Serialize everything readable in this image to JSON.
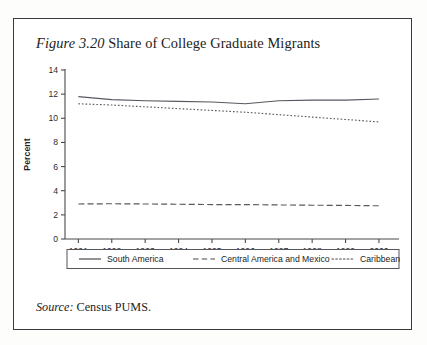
{
  "figure": {
    "number_label": "Figure 3.20",
    "title_text": "Share of College Graduate Migrants",
    "source_label": "Source:",
    "source_text": "Census PUMS."
  },
  "chart_data": {
    "type": "line",
    "title": "Figure 3.20 Share of College Graduate Migrants",
    "xlabel": "",
    "ylabel": "Percent",
    "x": [
      1991,
      1992,
      1993,
      1994,
      1995,
      1996,
      1997,
      1998,
      1999,
      2000
    ],
    "categories": [
      "1991",
      "1992",
      "1993",
      "1994",
      "1995",
      "1996",
      "1997",
      "1998",
      "1999",
      "2000"
    ],
    "xlim": [
      1990.6,
      2000.6
    ],
    "ylim": [
      0,
      14
    ],
    "yticks": [
      0,
      2,
      4,
      6,
      8,
      10,
      12,
      14
    ],
    "ytick_labels": [
      "0",
      "2",
      "4",
      "6",
      "8",
      "10",
      "12",
      "14"
    ],
    "grid": false,
    "legend_position": "bottom",
    "series": [
      {
        "name": "South America",
        "style": "solid",
        "values": [
          11.8,
          11.55,
          11.45,
          11.4,
          11.35,
          11.2,
          11.45,
          11.5,
          11.5,
          11.6
        ]
      },
      {
        "name": "Central America and Mexico",
        "style": "dashed",
        "values": [
          2.9,
          2.92,
          2.9,
          2.88,
          2.85,
          2.85,
          2.82,
          2.8,
          2.78,
          2.75
        ]
      },
      {
        "name": "Caribbean",
        "style": "dotted",
        "values": [
          11.2,
          11.1,
          10.95,
          10.8,
          10.65,
          10.5,
          10.3,
          10.1,
          9.9,
          9.7
        ]
      }
    ]
  }
}
